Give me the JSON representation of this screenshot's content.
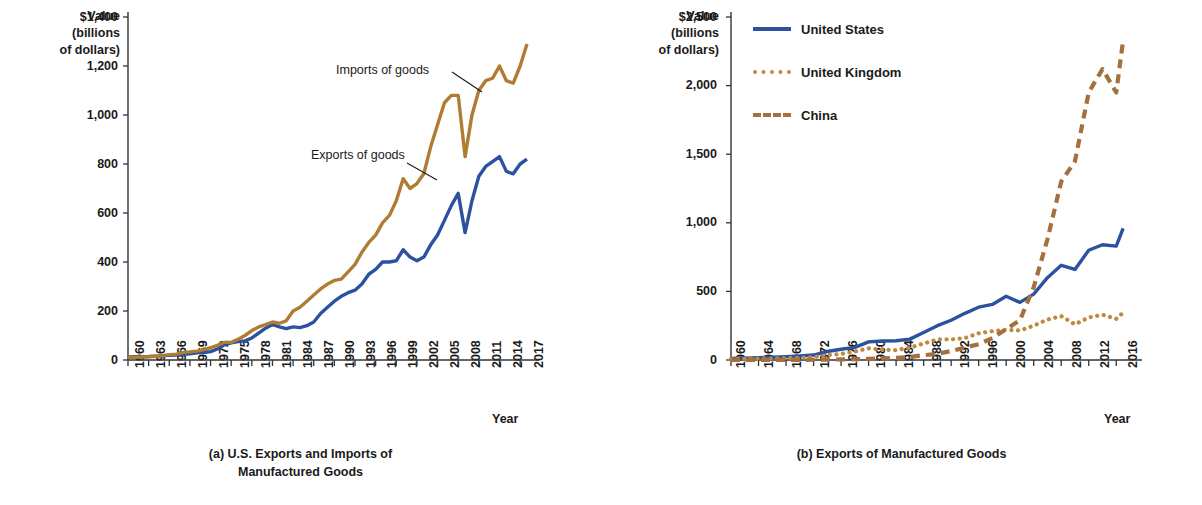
{
  "figure": {
    "colors": {
      "us_blue": "#2a52a0",
      "imports_brown": "#b07c33",
      "uk_tan": "#c08a3e",
      "china_brown": "#a4703f",
      "axis": "#333333",
      "text": "#1a1a1a"
    }
  },
  "panel_a": {
    "axis_title_line1": "Value",
    "axis_title_line2": "(billions",
    "axis_title_line3": "of dollars)",
    "xaxis_name": "Year",
    "caption_line1": "(a) U.S. Exports and Imports of",
    "caption_line2": "Manufactured Goods",
    "annotation_imports": "Imports of goods",
    "annotation_exports": "Exports of goods"
  },
  "panel_b": {
    "axis_title_line1": "Value",
    "axis_title_line2": "(billions",
    "axis_title_line3": "of dollars)",
    "xaxis_name": "Year",
    "caption_line1": "(b) Exports of Manufactured Goods",
    "legend": [
      {
        "label": "United States",
        "style": "solid",
        "color": "#2a52a0"
      },
      {
        "label": "United Kingdom",
        "style": "dotted",
        "color": "#c08a3e"
      },
      {
        "label": "China",
        "style": "dashed",
        "color": "#a4703f"
      }
    ]
  },
  "chart_data": [
    {
      "id": "a",
      "type": "line",
      "title": "(a) U.S. Exports and Imports of Manufactured Goods",
      "xlabel": "Year",
      "ylabel": "Value (billions of dollars)",
      "xlim": [
        1960,
        2018
      ],
      "ylim": [
        0,
        1400
      ],
      "yticks": [
        0,
        200,
        400,
        600,
        800,
        1000,
        1200,
        1400
      ],
      "ytick_labels": [
        "0",
        "200",
        "400",
        "600",
        "800",
        "1,000",
        "1,200",
        "$1,400"
      ],
      "xticks": [
        1960,
        1963,
        1966,
        1969,
        1972,
        1975,
        1978,
        1981,
        1984,
        1987,
        1990,
        1993,
        1996,
        1999,
        2002,
        2005,
        2008,
        2011,
        2014,
        2017
      ],
      "grid": false,
      "legend_position": "inline-annotations",
      "x": [
        1960,
        1961,
        1962,
        1963,
        1964,
        1965,
        1966,
        1967,
        1968,
        1969,
        1970,
        1971,
        1972,
        1973,
        1974,
        1975,
        1976,
        1977,
        1978,
        1979,
        1980,
        1981,
        1982,
        1983,
        1984,
        1985,
        1986,
        1987,
        1988,
        1989,
        1990,
        1991,
        1992,
        1993,
        1994,
        1995,
        1996,
        1997,
        1998,
        1999,
        2000,
        2001,
        2002,
        2003,
        2004,
        2005,
        2006,
        2007,
        2008,
        2009,
        2010,
        2011,
        2012,
        2013,
        2014,
        2015,
        2016,
        2017,
        2018
      ],
      "series": [
        {
          "name": "Exports of goods",
          "color": "#2a52a0",
          "style": "solid",
          "values": [
            12,
            13,
            13,
            14,
            16,
            17,
            19,
            20,
            23,
            25,
            29,
            30,
            34,
            45,
            62,
            70,
            75,
            78,
            90,
            110,
            130,
            145,
            135,
            128,
            135,
            132,
            140,
            155,
            190,
            215,
            240,
            260,
            275,
            285,
            310,
            350,
            370,
            400,
            400,
            405,
            450,
            420,
            405,
            420,
            470,
            510,
            570,
            630,
            680,
            520,
            650,
            750,
            790,
            810,
            830,
            770,
            760,
            800,
            820
          ],
          "yunit": "billions of dollars"
        },
        {
          "name": "Imports of goods",
          "color": "#b07c33",
          "style": "solid",
          "values": [
            11,
            11,
            12,
            13,
            15,
            18,
            22,
            24,
            30,
            33,
            36,
            42,
            50,
            60,
            72,
            72,
            85,
            100,
            120,
            135,
            145,
            155,
            150,
            160,
            200,
            215,
            240,
            265,
            290,
            310,
            325,
            330,
            360,
            390,
            440,
            480,
            510,
            560,
            590,
            650,
            740,
            700,
            720,
            760,
            870,
            960,
            1050,
            1080,
            1080,
            830,
            1000,
            1100,
            1140,
            1150,
            1200,
            1140,
            1130,
            1200,
            1290
          ],
          "yunit": "billions of dollars"
        }
      ]
    },
    {
      "id": "b",
      "type": "line",
      "title": "(b) Exports of Manufactured Goods",
      "xlabel": "Year",
      "ylabel": "Value (billions of dollars)",
      "xlim": [
        1960,
        2018
      ],
      "ylim": [
        0,
        2500
      ],
      "yticks": [
        0,
        500,
        1000,
        1500,
        2000,
        2500
      ],
      "ytick_labels": [
        "0",
        "500",
        "1,000",
        "1,500",
        "2,000",
        "$2,500"
      ],
      "xticks": [
        1960,
        1964,
        1968,
        1972,
        1976,
        1980,
        1984,
        1988,
        1992,
        1996,
        2000,
        2004,
        2008,
        2012,
        2016
      ],
      "grid": false,
      "legend_position": "top-right-inside",
      "x": [
        1960,
        1962,
        1964,
        1966,
        1968,
        1970,
        1972,
        1974,
        1976,
        1978,
        1980,
        1982,
        1984,
        1986,
        1988,
        1990,
        1992,
        1994,
        1996,
        1998,
        2000,
        2002,
        2004,
        2006,
        2008,
        2010,
        2012,
        2014,
        2016,
        2017
      ],
      "series": [
        {
          "name": "United States",
          "color": "#2a52a0",
          "style": "solid",
          "values": [
            12,
            14,
            17,
            20,
            24,
            30,
            36,
            62,
            78,
            92,
            132,
            138,
            140,
            152,
            200,
            250,
            290,
            340,
            385,
            405,
            465,
            420,
            480,
            600,
            690,
            660,
            800,
            840,
            830,
            960
          ]
        },
        {
          "name": "United Kingdom",
          "color": "#c08a3e",
          "style": "dotted",
          "values": [
            8,
            9,
            10,
            11,
            14,
            17,
            20,
            36,
            44,
            62,
            85,
            75,
            72,
            90,
            120,
            150,
            150,
            160,
            195,
            210,
            220,
            215,
            250,
            295,
            320,
            260,
            310,
            330,
            300,
            345
          ]
        },
        {
          "name": "China",
          "color": "#a4703f",
          "style": "dashed",
          "values": [
            1,
            1,
            1,
            1,
            1,
            1,
            2,
            3,
            4,
            6,
            9,
            12,
            15,
            22,
            35,
            45,
            65,
            90,
            115,
            160,
            225,
            290,
            530,
            880,
            1300,
            1450,
            1950,
            2120,
            1950,
            2330
          ]
        }
      ]
    }
  ]
}
